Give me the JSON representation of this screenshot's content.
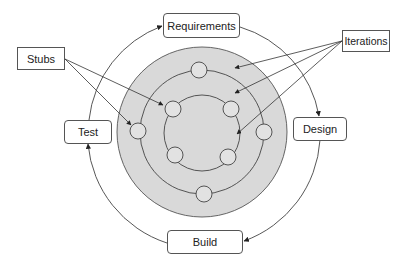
{
  "diagram": {
    "colors": {
      "ring_fill": "#d9d9d9",
      "node_fill": "#e2e2e2",
      "stroke": "#444444"
    },
    "phases": [
      {
        "id": "requirements",
        "label": "Requirements"
      },
      {
        "id": "design",
        "label": "Design"
      },
      {
        "id": "build",
        "label": "Build"
      },
      {
        "id": "test",
        "label": "Test"
      }
    ],
    "callouts": [
      {
        "id": "stubs",
        "label": "Stubs"
      },
      {
        "id": "iterations",
        "label": "Iterations"
      }
    ],
    "cycle_flow": [
      "Requirements",
      "Design",
      "Build",
      "Test",
      "Requirements"
    ],
    "rings": {
      "count": 3,
      "middle_ring_nodes": 4,
      "inner_ring_nodes": 4
    }
  }
}
